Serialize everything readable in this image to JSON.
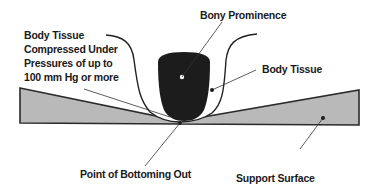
{
  "labels": {
    "compressed_tissue": {
      "line1": "Body Tissue",
      "line2": "Compressed Under",
      "line3": "Pressures of up to",
      "line4": "100 mm Hg or more"
    },
    "bony_prominence": "Bony Prominence",
    "body_tissue": "Body Tissue",
    "bottoming_out": "Point of Bottoming Out",
    "support_surface": "Support Surface"
  },
  "colors": {
    "surface_fill": "#b9b9b9",
    "bone_fill": "#1c1c1c",
    "outline": "#222222",
    "background": "#ffffff"
  }
}
